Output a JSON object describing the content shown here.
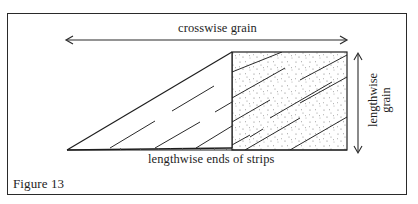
{
  "figure": {
    "caption": "Figure 13",
    "labels": {
      "crosswise": "crosswise grain",
      "lengthwise_line1": "lengthwise",
      "lengthwise_line2": "grain",
      "ends": "lengthwise ends of strips"
    },
    "colors": {
      "line": "#1e1e1e",
      "stipple": "#6a6a6a",
      "background": "#ffffff"
    }
  }
}
